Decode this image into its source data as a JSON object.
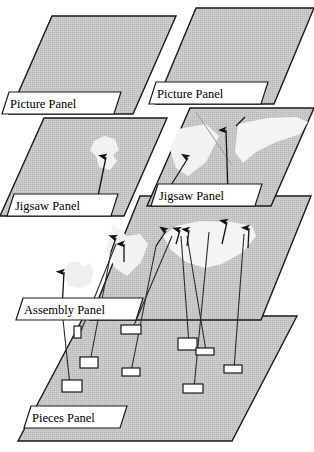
{
  "figure": {
    "kind": "layered-panel-diagram",
    "background_color": "#ffffff",
    "panel_fill": "#c8c8c8",
    "panel_stroke": "#1a1a1a",
    "piece_highlight_fill": "#f0f0f0",
    "label_box_fill": "#ffffff",
    "label_text_color": "#000000",
    "arrow_color": "#1a1a1a",
    "piece_box_fill": "#ffffff"
  },
  "labels": {
    "picture_panel_left": "Picture Panel",
    "picture_panel_right": "Picture Panel",
    "jigsaw_panel_left": "Jigsaw Panel",
    "jigsaw_panel_right": "Jigsaw Panel",
    "assembly_panel": "Assembly Panel",
    "pieces_panel": "Pieces Panel"
  },
  "rows": [
    {
      "name": "picture-row",
      "count": 2,
      "label": "Picture Panel"
    },
    {
      "name": "jigsaw-row",
      "count": 2,
      "label": "Jigsaw Panel"
    },
    {
      "name": "assembly-row",
      "count": 1,
      "label": "Assembly Panel"
    },
    {
      "name": "pieces-row",
      "count": 1,
      "label": "Pieces Panel"
    }
  ],
  "pieces": [
    {
      "id": "piece-1",
      "x": 66,
      "y": 386
    },
    {
      "id": "piece-2",
      "x": 86,
      "y": 362
    },
    {
      "id": "piece-3",
      "x": 77,
      "y": 331
    },
    {
      "id": "piece-4",
      "x": 127,
      "y": 372
    },
    {
      "id": "piece-5",
      "x": 128,
      "y": 330
    },
    {
      "id": "piece-6",
      "x": 185,
      "y": 344
    },
    {
      "id": "piece-7",
      "x": 203,
      "y": 351
    },
    {
      "id": "piece-8",
      "x": 190,
      "y": 388
    },
    {
      "id": "piece-9",
      "x": 230,
      "y": 369
    }
  ],
  "arrow_count": 12
}
